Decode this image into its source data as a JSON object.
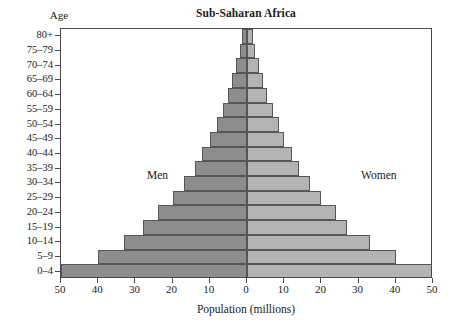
{
  "chart_data": {
    "type": "bar",
    "subtype": "population-pyramid",
    "title": "Sub-Saharan Africa",
    "xlabel": "Population (millions)",
    "ylabel": "Age",
    "grid": false,
    "legend_position": "inside-plot",
    "xlim": [
      -50,
      50
    ],
    "x_ticks": [
      50,
      40,
      30,
      20,
      10,
      0,
      10,
      20,
      30,
      40,
      50
    ],
    "x_tick_values": [
      -50,
      -40,
      -30,
      -20,
      -10,
      0,
      10,
      20,
      30,
      40,
      50
    ],
    "categories": [
      "80+",
      "75-79",
      "70-74",
      "65-69",
      "60-64",
      "55-59",
      "50-54",
      "45-49",
      "40-44",
      "35-39",
      "30-34",
      "25-29",
      "20-24",
      "15-19",
      "10-14",
      "5-9",
      "0-4"
    ],
    "series": [
      {
        "name": "Men",
        "side": "left",
        "color": "#8d8d8d",
        "values": [
          1.3,
          2.0,
          3.0,
          4.0,
          5.0,
          6.5,
          8.0,
          10.0,
          12.0,
          14.0,
          17.0,
          20.0,
          24.0,
          28.0,
          33.0,
          40.0,
          50.0
        ]
      },
      {
        "name": "Women",
        "side": "right",
        "color": "#b3b3b3",
        "values": [
          1.5,
          2.2,
          3.2,
          4.2,
          5.5,
          7.0,
          8.5,
          10.0,
          12.0,
          14.0,
          17.0,
          20.0,
          24.0,
          27.0,
          33.0,
          40.0,
          50.0
        ]
      }
    ],
    "annotations": [
      {
        "name": "men-label",
        "text": "Men"
      },
      {
        "name": "women-label",
        "text": "Women"
      }
    ]
  },
  "axes": {
    "age_caption": "Age"
  }
}
